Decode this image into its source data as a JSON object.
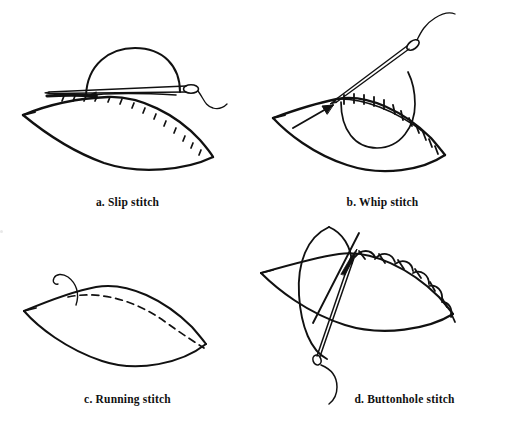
{
  "figure": {
    "background_color": "#ffffff",
    "ink_color": "#111111",
    "panel_count": 4,
    "layout": "2x2 grid"
  },
  "panels": [
    {
      "key": "a",
      "caption": "a. Slip stitch",
      "label_letter": "a.",
      "stitch_name": "Slip stitch",
      "description": "Leaf-shaped fabric piece with a raised semicircular fold, a horizontal threaded needle passing through the fold, and small slanted stitch ticks along the curved seam.",
      "elements": {
        "fabric": "leaf-shape",
        "fold_arc": "semicircle-above-seam",
        "needle": "horizontal-needle",
        "needle_orientation": "horizontal, eye at right",
        "thread": "trailing-thread-right",
        "stitch_marks": "slanted ticks along lower-right curve",
        "stitch_mark_count": 14
      }
    },
    {
      "key": "b",
      "caption": "b. Whip stitch",
      "label_letter": "b.",
      "stitch_name": "Whip stitch",
      "description": "Leaf-shaped fabric with a diagonal threaded needle entering at the upper-left seam point, an arrow pointing to the entry point, a large loop of thread, and whipped tick stitches over the seam edge.",
      "elements": {
        "fabric": "leaf-shape",
        "needle": "diagonal-needle",
        "needle_orientation": "diagonal up-right, eye at top-right",
        "thread": "trailing-thread-top-right",
        "thread_loop": "large-loop-under-seam",
        "arrow": "arrow-pointing-to-entry-point",
        "stitch_marks": "perpendicular whipped ticks along seam",
        "stitch_mark_count": 16
      }
    },
    {
      "key": "c",
      "caption": "c. Running stitch",
      "label_letter": "c.",
      "stitch_name": "Running stitch",
      "description": "Leaf-shaped fabric with a dashed running-stitch line following just inside the upper seam, and a short curling thread tail emerging at the left.",
      "elements": {
        "fabric": "leaf-shape",
        "stitch_line": "dashed-running-line",
        "thread": "curling-thread-tail-left",
        "dash_count": 17
      }
    },
    {
      "key": "d",
      "caption": "d. Buttonhole stitch",
      "label_letter": "d.",
      "stitch_name": "Buttonhole stitch",
      "description": "Leaf-shaped fabric crossed by a large vertical loop of thread and a steeply angled threaded needle whose eye is at the bottom, with looped buttonhole stitches along the upper right seam.",
      "elements": {
        "fabric": "leaf-shape",
        "needle": "steep-diagonal-needle",
        "needle_orientation": "steep diagonal, point up-right, eye at bottom-left",
        "thread": "trailing-thread-bottom",
        "thread_loop": "large-vertical-loop",
        "stitch_marks": "looped buttonhole stitches with crossbars",
        "stitch_loop_count": 7
      }
    }
  ]
}
